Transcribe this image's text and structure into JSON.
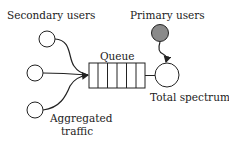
{
  "diagram": {
    "labels": {
      "secondary_users": "Secondary users",
      "primary_users": "Primary users",
      "queue": "Queue",
      "total_spectrum": "Total spectrum",
      "aggregated_traffic_line1": "Aggregated",
      "aggregated_traffic_line2": "traffic"
    },
    "nodes": [
      {
        "id": "secondary-user-1",
        "type": "circle",
        "fill": "#ffffff"
      },
      {
        "id": "secondary-user-2",
        "type": "circle",
        "fill": "#ffffff"
      },
      {
        "id": "secondary-user-3",
        "type": "circle",
        "fill": "#ffffff"
      },
      {
        "id": "primary-user",
        "type": "circle",
        "fill": "#8a8a8a"
      },
      {
        "id": "queue",
        "type": "queue",
        "slots": 6
      },
      {
        "id": "total-spectrum",
        "type": "circle",
        "fill": "#ffffff"
      }
    ],
    "edges": [
      {
        "from": "secondary-user-1",
        "to": "queue"
      },
      {
        "from": "secondary-user-2",
        "to": "queue"
      },
      {
        "from": "secondary-user-3",
        "to": "queue"
      },
      {
        "from": "queue",
        "to": "total-spectrum"
      },
      {
        "from": "primary-user",
        "to": "total-spectrum"
      }
    ],
    "colors": {
      "stroke": "#222222",
      "primary_fill": "#8a8a8a",
      "background": "#ffffff"
    }
  }
}
